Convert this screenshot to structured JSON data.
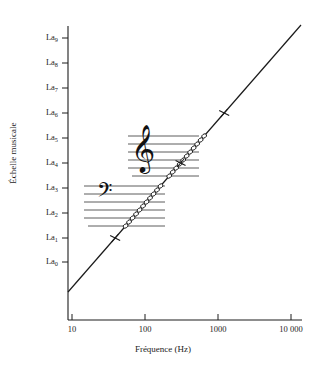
{
  "figure": {
    "background": "#ffffff",
    "ink_color": "#1c1c1c"
  },
  "axes": {
    "x": {
      "title": "Fréquence (Hz)",
      "scale": "log",
      "ticks": [
        {
          "label": "10",
          "value": 10,
          "px": 72
        },
        {
          "label": "100",
          "value": 100,
          "px": 145
        },
        {
          "label": "1000",
          "value": 1000,
          "px": 218
        },
        {
          "label": "10 000",
          "value": 10000,
          "px": 291
        }
      ],
      "range": [
        10,
        10000
      ]
    },
    "y": {
      "title": "Échelle musicale",
      "scale": "octave",
      "ticks": [
        {
          "base": "La",
          "sub": "9",
          "value": 9,
          "px": 38
        },
        {
          "base": "La",
          "sub": "8",
          "value": 8,
          "px": 63
        },
        {
          "base": "La",
          "sub": "7",
          "value": 7,
          "px": 88
        },
        {
          "base": "La",
          "sub": "6",
          "value": 6,
          "px": 113
        },
        {
          "base": "La",
          "sub": "5",
          "value": 5,
          "px": 138
        },
        {
          "base": "La",
          "sub": "4",
          "value": 4,
          "px": 163
        },
        {
          "base": "La",
          "sub": "3",
          "value": 3,
          "px": 188
        },
        {
          "base": "La",
          "sub": "2",
          "value": 2,
          "px": 213
        },
        {
          "base": "La",
          "sub": "1",
          "value": 1,
          "px": 238
        },
        {
          "base": "La",
          "sub": "0",
          "value": 0,
          "px": 262
        }
      ],
      "range": [
        0,
        9
      ]
    }
  },
  "chart_data": {
    "type": "line",
    "title": "",
    "xlabel": "Fréquence (Hz)",
    "ylabel": "Échelle musicale",
    "xscale": "log",
    "xlim": [
      10,
      10000
    ],
    "ylim_labels": [
      "La0",
      "La9"
    ],
    "grid": false,
    "legend": null,
    "series": [
      {
        "name": "Correspondance fréquence / octave",
        "description": "Droite reliant la fréquence (échelle logarithmique) à l'octave musicale",
        "x": [
          27.5,
          55,
          110,
          220,
          440,
          880,
          1760,
          3520,
          7040
        ],
        "y_labels": [
          "La0",
          "La1",
          "La2",
          "La3",
          "La4",
          "La5",
          "La6",
          "La7",
          "La8"
        ],
        "y": [
          0,
          1,
          2,
          3,
          4,
          5,
          6,
          7,
          8
        ],
        "endpoints_px": [
          [
            68,
            292
          ],
          [
            301,
            25
          ]
        ]
      }
    ],
    "annotations": [
      {
        "kind": "staff",
        "clef": "treble",
        "glyph": "𝄞",
        "lines": 5,
        "ledger_lines_below": 1,
        "x_start_px": 128,
        "x_end_px": 199,
        "y_top_px": 136,
        "line_spacing_px": 8
      },
      {
        "kind": "staff",
        "clef": "bass",
        "glyph": "𝄢",
        "lines": 5,
        "ledger_lines_below": 1,
        "x_start_px": 84,
        "x_end_px": 165,
        "y_top_px": 186,
        "line_spacing_px": 8
      }
    ],
    "markers": {
      "open_circle_note": "petites notes rondes sur la droite aux croisements des portées",
      "cross_note": "croix aux octaves La1, La4, La6"
    }
  }
}
